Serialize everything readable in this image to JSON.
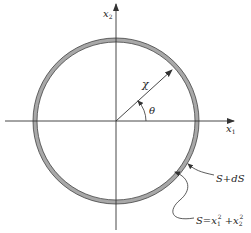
{
  "diagram": {
    "axes": {
      "x_label": "x",
      "x_sub": "1",
      "y_label": "x",
      "y_sub": "2"
    },
    "radius_label": "χ",
    "angle_label": "θ",
    "outer_label": "S+dS",
    "inner_label": {
      "prefix": "S=x",
      "sub1": "1",
      "sup1": "2",
      "mid": " +x",
      "sub2": "2",
      "sup2": "2"
    },
    "colors": {
      "ring_fill": "#a8a8a8",
      "line": "#333333",
      "background": "#ffffff"
    }
  }
}
